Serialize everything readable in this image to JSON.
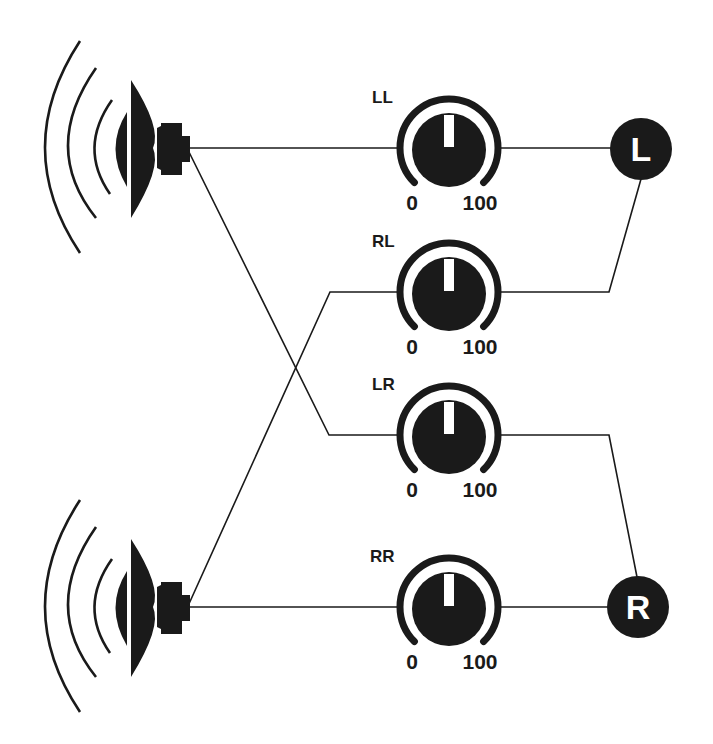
{
  "diagram": {
    "type": "audio-crossfeed-mixer",
    "colors": {
      "ink": "#1a1a1a",
      "background": "#ffffff",
      "indicator": "#ffffff"
    },
    "speakers": [
      {
        "id": "speaker-top",
        "icon": "speaker-icon",
        "cy": 148
      },
      {
        "id": "speaker-bottom",
        "icon": "speaker-icon",
        "cy": 607
      }
    ],
    "knobs": [
      {
        "id": "LL",
        "label": "LL",
        "min_label": "0",
        "max_label": "100",
        "cy": 148
      },
      {
        "id": "RL",
        "label": "RL",
        "min_label": "0",
        "max_label": "100",
        "cy": 292
      },
      {
        "id": "LR",
        "label": "LR",
        "min_label": "0",
        "max_label": "100",
        "cy": 435
      },
      {
        "id": "RR",
        "label": "RR",
        "min_label": "0",
        "max_label": "100",
        "cy": 607
      }
    ],
    "outputs": [
      {
        "id": "L",
        "label": "L",
        "cy": 149
      },
      {
        "id": "R",
        "label": "R",
        "cy": 607
      }
    ],
    "connections": [
      {
        "from": "speaker-top",
        "to": "LL"
      },
      {
        "from": "speaker-top",
        "to": "LR"
      },
      {
        "from": "speaker-bottom",
        "to": "RL"
      },
      {
        "from": "speaker-bottom",
        "to": "RR"
      },
      {
        "from": "LL",
        "to": "L"
      },
      {
        "from": "RL",
        "to": "L"
      },
      {
        "from": "LR",
        "to": "R"
      },
      {
        "from": "RR",
        "to": "R"
      }
    ]
  }
}
